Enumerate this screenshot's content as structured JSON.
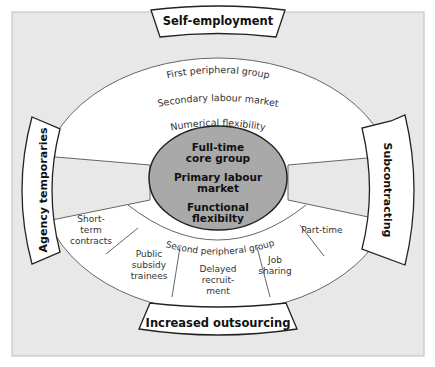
{
  "colors": {
    "panel_bg": "#e8e8e8",
    "panel_border": "#bdbdbd",
    "white": "#ffffff",
    "core_fill": "#a9a9a9",
    "stroke": "#555555",
    "dark_stroke": "#222222"
  },
  "outer_labels": {
    "top": "Self-employment",
    "left": "Agency temporaries",
    "right": "Subcontracting",
    "bottom": "Increased outsourcing"
  },
  "first_peripheral": {
    "line1": "First peripheral group",
    "line2": "Secondary labour market",
    "line3": "Numerical flexibility"
  },
  "core": {
    "line1": "Full-time",
    "line2": "core group",
    "line3": "Primary labour",
    "line4": "market",
    "line5": "Functional",
    "line6": "flexibilty"
  },
  "second_peripheral": {
    "label": "Second peripheral group"
  },
  "segments": {
    "short_term": [
      "Short-",
      "term",
      "contracts"
    ],
    "public_subsidy": [
      "Public",
      "subsidy",
      "trainees"
    ],
    "delayed": [
      "Delayed",
      "recruit-",
      "ment"
    ],
    "job_sharing": [
      "Job",
      "sharing"
    ],
    "part_time": [
      "Part-time"
    ]
  }
}
